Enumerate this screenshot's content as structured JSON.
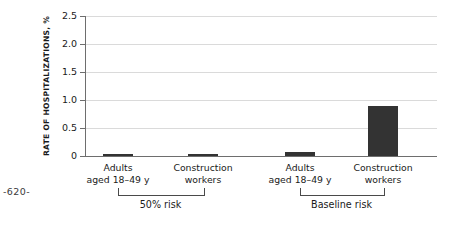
{
  "page_marker": "-620-",
  "chart_data": {
    "type": "bar",
    "title": "",
    "xlabel": "",
    "ylabel": "RATE OF HOSPITALIZATIONS, %",
    "ylim": [
      0,
      2.5
    ],
    "yticks": [
      "0",
      "0.5",
      "1.0",
      "1.5",
      "2.0",
      "2.5"
    ],
    "ytick_values": [
      0,
      0.5,
      1.0,
      1.5,
      2.0,
      2.5
    ],
    "grid": "horizontal",
    "legend": "none",
    "bar_color": "#333333",
    "gridline_color": "#dadada",
    "axis_color": "#6e6e6e",
    "categories": [
      "Adults aged 18-49 y",
      "Construction workers",
      "Adults aged 18-49 y",
      "Construction workers"
    ],
    "values": [
      0.02,
      0.04,
      0.08,
      0.9
    ],
    "groups": [
      {
        "label": "50% risk",
        "categories": [
          {
            "line1": "Adults",
            "line2": "aged 18–49 y",
            "value": 0.02
          },
          {
            "line1": "Construction",
            "line2": "workers",
            "value": 0.04
          }
        ]
      },
      {
        "label": "Baseline risk",
        "categories": [
          {
            "line1": "Adults",
            "line2": "aged 18–49 y",
            "value": 0.08
          },
          {
            "line1": "Construction",
            "line2": "workers",
            "value": 0.9
          }
        ]
      }
    ]
  }
}
